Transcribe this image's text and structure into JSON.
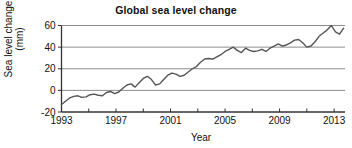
{
  "chart_data": {
    "type": "line",
    "title": "Global sea level change",
    "xlabel": "Year",
    "ylabel": "Sea level change\n(mm)",
    "ylabel_line1": "Sea level change",
    "ylabel_line2": "(mm)",
    "xlim": [
      1993,
      2013.8
    ],
    "ylim": [
      -20,
      60
    ],
    "yticks": [
      60,
      40,
      20,
      0,
      -20
    ],
    "ytick_labels": [
      "60",
      "40",
      "20",
      "0",
      "-20"
    ],
    "xticks": [
      1993,
      1995,
      1997,
      1999,
      2001,
      2003,
      2005,
      2007,
      2009,
      2011,
      2013
    ],
    "xtick_labels": [
      "1993",
      "",
      "1997",
      "",
      "2001",
      "",
      "2005",
      "",
      "2009",
      "",
      "2013"
    ],
    "xtick_labels_major": [
      "1993",
      "1997",
      "2001",
      "2005",
      "2009",
      "2013"
    ],
    "grid": "horizontal",
    "legend": "none",
    "line_color": "#555555",
    "grid_color": "#8c8c8c",
    "axis_color": "#333333",
    "series": [
      {
        "name": "Global mean sea level",
        "x": [
          1993.0,
          1993.3,
          1993.6,
          1993.9,
          1994.2,
          1994.5,
          1994.8,
          1995.1,
          1995.4,
          1995.7,
          1996.0,
          1996.3,
          1996.6,
          1996.9,
          1997.2,
          1997.5,
          1997.8,
          1998.1,
          1998.4,
          1998.7,
          1999.0,
          1999.3,
          1999.6,
          1999.9,
          2000.2,
          2000.5,
          2000.8,
          2001.1,
          2001.4,
          2001.7,
          2002.0,
          2002.3,
          2002.6,
          2002.9,
          2003.2,
          2003.5,
          2003.8,
          2004.1,
          2004.4,
          2004.7,
          2005.0,
          2005.3,
          2005.6,
          2005.9,
          2006.2,
          2006.5,
          2006.8,
          2007.1,
          2007.4,
          2007.7,
          2008.0,
          2008.3,
          2008.6,
          2008.9,
          2009.2,
          2009.5,
          2009.8,
          2010.1,
          2010.4,
          2010.7,
          2011.0,
          2011.3,
          2011.6,
          2011.9,
          2012.2,
          2012.5,
          2012.8,
          2013.1,
          2013.4,
          2013.7
        ],
        "y": [
          -13.0,
          -10.0,
          -7.0,
          -5.5,
          -5.0,
          -6.5,
          -6.0,
          -4.0,
          -3.5,
          -4.5,
          -5.0,
          -2.0,
          -1.0,
          -3.0,
          -1.5,
          2.0,
          5.0,
          6.0,
          3.0,
          7.0,
          11.0,
          13.0,
          10.0,
          5.0,
          6.0,
          10.0,
          14.0,
          16.0,
          15.0,
          13.0,
          14.0,
          17.0,
          20.0,
          22.0,
          26.0,
          29.0,
          29.5,
          29.0,
          31.0,
          33.0,
          36.0,
          38.0,
          40.0,
          37.0,
          35.0,
          39.0,
          37.0,
          36.0,
          36.5,
          38.0,
          36.0,
          39.0,
          41.0,
          43.0,
          41.0,
          42.0,
          44.0,
          46.5,
          47.0,
          44.0,
          40.0,
          41.0,
          45.0,
          50.0,
          53.0,
          56.0,
          60.0,
          54.0,
          52.0,
          57.5
        ]
      }
    ]
  },
  "meta": {
    "title_text": "Global sea level change"
  }
}
